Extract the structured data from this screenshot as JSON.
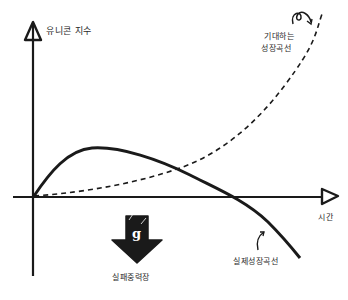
{
  "diagram": {
    "y_axis_label": "유니콘 지수",
    "x_axis_label": "시간",
    "expected_curve_label_line1": "기대하는",
    "expected_curve_label_line2": "성장곡선",
    "actual_curve_label": "실제성장곡선",
    "gravity_arrow_letter": "g",
    "gravity_label": "실패중력장",
    "colors": {
      "ink": "#1a1a1a",
      "background": "#ffffff"
    },
    "curves": [
      {
        "name": "expected-growth-curve",
        "style": "dashed",
        "shape": "exponential rise"
      },
      {
        "name": "actual-growth-curve",
        "style": "solid",
        "shape": "rise, peak, decline below zero"
      }
    ]
  }
}
